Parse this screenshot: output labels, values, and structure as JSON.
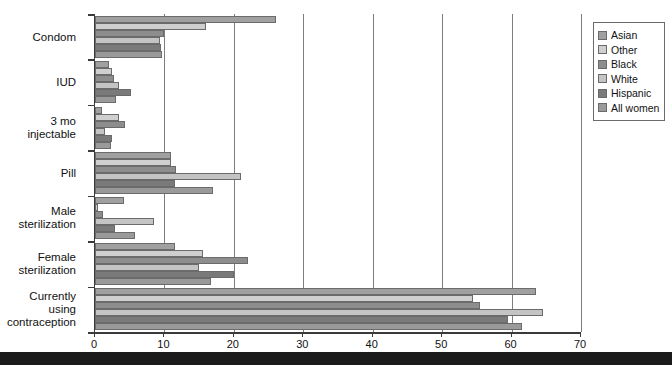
{
  "chart_data": {
    "type": "bar",
    "orientation": "horizontal",
    "title": "",
    "subtitle": "",
    "xlabel": "",
    "ylabel": "",
    "xlim": [
      0,
      70
    ],
    "xticks": [
      0,
      10,
      20,
      30,
      40,
      50,
      60,
      70
    ],
    "xtick_labels": [
      "0",
      "10",
      "20",
      "30",
      "40",
      "50",
      "60",
      "70"
    ],
    "grid": true,
    "grid_axis": "x",
    "legend_position": "top-right",
    "categories": [
      "Condom",
      "IUD",
      "3 mo injectable",
      "Pill",
      "Male\nsterilization",
      "Female\nsterilization",
      "Currently using\ncontraception"
    ],
    "series": [
      {
        "name": "Asian",
        "color": "#a0a0a0",
        "values": [
          26.0,
          2.0,
          1.0,
          11.0,
          4.2,
          11.5,
          63.5
        ]
      },
      {
        "name": "Other",
        "color": "#cfcfcf",
        "values": [
          16.0,
          2.4,
          3.5,
          11.0,
          0.5,
          15.5,
          54.5
        ]
      },
      {
        "name": "Black",
        "color": "#8d8d8d",
        "values": [
          10.0,
          2.8,
          4.3,
          11.6,
          1.2,
          22.0,
          55.5
        ]
      },
      {
        "name": "White",
        "color": "#c4c4c4",
        "values": [
          9.3,
          3.5,
          1.5,
          21.0,
          8.5,
          15.0,
          64.5
        ]
      },
      {
        "name": "Hispanic",
        "color": "#7a7a7a",
        "values": [
          9.5,
          5.2,
          2.5,
          11.5,
          2.9,
          20.0,
          59.5
        ]
      },
      {
        "name": "All women",
        "color": "#9a9a9a",
        "values": [
          9.6,
          3.0,
          2.3,
          17.0,
          5.7,
          16.7,
          61.5
        ]
      }
    ]
  },
  "legend": {
    "items": [
      {
        "label": "Asian",
        "color": "#a0a0a0"
      },
      {
        "label": "Other",
        "color": "#cfcfcf"
      },
      {
        "label": "Black",
        "color": "#8d8d8d"
      },
      {
        "label": "White",
        "color": "#c4c4c4"
      },
      {
        "label": "Hispanic",
        "color": "#7a7a7a"
      },
      {
        "label": "All women",
        "color": "#9a9a9a"
      }
    ]
  },
  "colors": {
    "axis": "#3a3a3a",
    "grid": "#7d7d7d",
    "bar_border": "#6b6b6b",
    "background": "#ffffff",
    "bottom_band": "#1b1b1b"
  }
}
